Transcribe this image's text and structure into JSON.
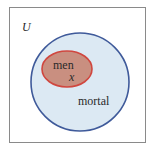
{
  "diagram": {
    "type": "venn",
    "universe_label": "U",
    "sets": [
      {
        "name": "mortal",
        "label": "mortal",
        "fill": "#dce9f3",
        "stroke": "#3f5a9a"
      },
      {
        "name": "men",
        "label": "men",
        "fill": "#c98f80",
        "stroke": "#d0473f",
        "subset_of": "mortal"
      }
    ],
    "element": {
      "label": "x",
      "in_set": "men"
    },
    "colors": {
      "frame": "#8a8a8a",
      "background": "#ffffff"
    }
  }
}
